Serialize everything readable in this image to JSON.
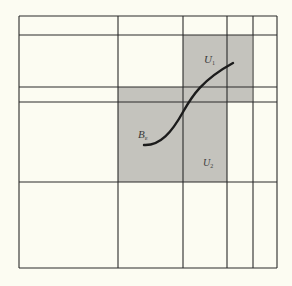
{
  "figure": {
    "background": "#fcfcf2",
    "line_color": "#2a2a2a",
    "shade_color": "#c4c3bd",
    "curve_color": "#1c1c1c"
  },
  "grid": {
    "outer_box": {
      "x1": 19,
      "y1": 16,
      "x2": 277,
      "y2": 268
    },
    "vertical_lines_x": [
      19,
      118,
      183,
      227,
      253,
      277
    ],
    "horizontal_lines_y": [
      16,
      35,
      87,
      102,
      182,
      268
    ]
  },
  "shaded_regions": [
    {
      "name": "U1-region",
      "x": 183,
      "y": 35,
      "width": 69,
      "height": 67
    },
    {
      "name": "U2-region",
      "x": 118,
      "y": 87,
      "width": 109,
      "height": 95
    }
  ],
  "curve": {
    "name": "B",
    "path": "M144,145 C160,146 172,132 183,112 C192,96 202,80 233,63"
  },
  "labels": {
    "u1": {
      "text": "U",
      "sub": "1",
      "x": 204,
      "y": 63
    },
    "b": {
      "text": "B",
      "sub": "ε",
      "x": 138,
      "y": 138
    },
    "u2": {
      "text": "U",
      "sub": "2",
      "x": 203,
      "y": 166
    }
  }
}
